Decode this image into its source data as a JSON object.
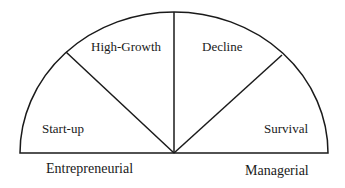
{
  "diagram": {
    "segments": [
      {
        "label": "Start-up"
      },
      {
        "label": "High-Growth"
      },
      {
        "label": "Decline"
      },
      {
        "label": "Survival"
      }
    ],
    "axis_labels": {
      "left": "Entrepreneurial",
      "right": "Managerial"
    },
    "line_color": "#1a1a1a"
  }
}
